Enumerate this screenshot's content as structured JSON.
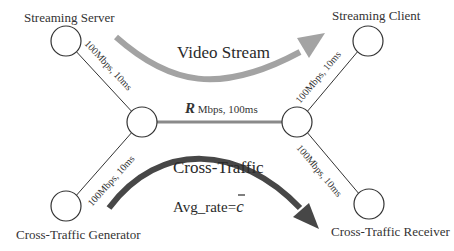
{
  "diagram": {
    "type": "network-topology",
    "nodes": [
      {
        "id": "streaming_server",
        "label": "Streaming Server",
        "cx": 66,
        "cy": 41,
        "r": 15
      },
      {
        "id": "left_router",
        "label": "",
        "cx": 142,
        "cy": 122,
        "r": 15
      },
      {
        "id": "right_router",
        "label": "",
        "cx": 297,
        "cy": 122,
        "r": 15
      },
      {
        "id": "streaming_client",
        "label": "Streaming Client",
        "cx": 368,
        "cy": 41,
        "r": 15
      },
      {
        "id": "cross_traffic_generator",
        "label": "Cross-Traffic Generator",
        "cx": 66,
        "cy": 206,
        "r": 15
      },
      {
        "id": "cross_traffic_receiver",
        "label": "Cross-Traffic Receiver",
        "cx": 369,
        "cy": 204,
        "r": 15
      }
    ],
    "labels": {
      "streaming_server": "Streaming Server",
      "streaming_client": "Streaming Client",
      "cross_traffic_generator": "Cross-Traffic Generator",
      "cross_traffic_receiver": "Cross-Traffic Receiver",
      "link_server": "100Mbps, 10ms",
      "link_client": "100Mbps, 10ms",
      "link_generator": "100Mbps, 10ms",
      "link_receiver": "100Mbps, 10ms",
      "bottleneck_var": "R",
      "bottleneck_rest": " Mbps, 100ms",
      "video_stream": "Video Stream",
      "cross_traffic": "Cross-Traffic",
      "avg_rate_prefix": "Avg_rate=",
      "avg_rate_var": "c",
      "avg_rate_bar": "¯"
    },
    "links": [
      {
        "from": "streaming_server",
        "to": "left_router",
        "label": "100Mbps, 10ms"
      },
      {
        "from": "cross_traffic_generator",
        "to": "left_router",
        "label": "100Mbps, 10ms"
      },
      {
        "from": "left_router",
        "to": "right_router",
        "label": "R Mbps, 100ms",
        "bottleneck": true
      },
      {
        "from": "right_router",
        "to": "streaming_client",
        "label": "100Mbps, 10ms"
      },
      {
        "from": "right_router",
        "to": "cross_traffic_receiver",
        "label": "100Mbps, 10ms"
      }
    ],
    "flows": [
      {
        "name": "Video Stream",
        "from": "streaming_server",
        "to": "streaming_client",
        "color": "#a3a3a3"
      },
      {
        "name": "Cross-Traffic",
        "from": "cross_traffic_generator",
        "to": "cross_traffic_receiver",
        "color": "#474747",
        "annotation": "Avg_rate = c̄"
      }
    ],
    "colors": {
      "node_stroke": "#333333",
      "link": "#333333",
      "bottleneck_link": "#8a8a8a",
      "video_arrow": "#a3a3a3",
      "cross_arrow": "#474747",
      "text": "#333333"
    }
  }
}
